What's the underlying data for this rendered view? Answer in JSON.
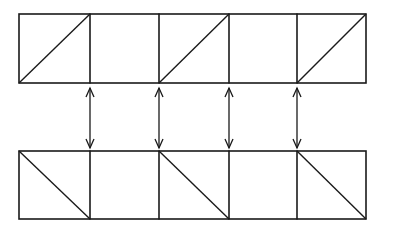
{
  "diagram": {
    "type": "strip-correspondence",
    "background": "#ffffff",
    "line_color": "#1a1a1a",
    "columns_x": [
      19,
      90,
      159,
      229,
      297,
      366
    ],
    "top_strip": {
      "y_top": 14,
      "y_bottom": 83,
      "cells": [
        {
          "index": 0,
          "diagonal": "up-right"
        },
        {
          "index": 1,
          "diagonal": "none"
        },
        {
          "index": 2,
          "diagonal": "up-right"
        },
        {
          "index": 3,
          "diagonal": "none"
        },
        {
          "index": 4,
          "diagonal": "up-right"
        }
      ]
    },
    "bottom_strip": {
      "y_top": 151,
      "y_bottom": 219,
      "cells": [
        {
          "index": 0,
          "diagonal": "down-right"
        },
        {
          "index": 1,
          "diagonal": "none"
        },
        {
          "index": 2,
          "diagonal": "down-right"
        },
        {
          "index": 3,
          "diagonal": "none"
        },
        {
          "index": 4,
          "diagonal": "down-right"
        }
      ]
    },
    "arrows": [
      {
        "x": 90,
        "y1": 88,
        "y2": 148,
        "heads": "both"
      },
      {
        "x": 159,
        "y1": 88,
        "y2": 148,
        "heads": "both"
      },
      {
        "x": 229,
        "y1": 88,
        "y2": 148,
        "heads": "both"
      },
      {
        "x": 297,
        "y1": 88,
        "y2": 148,
        "heads": "both"
      }
    ]
  }
}
